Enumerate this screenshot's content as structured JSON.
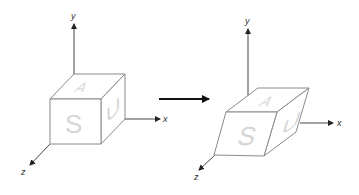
{
  "diagram": {
    "colors": {
      "axis": "#444444",
      "edge": "#8a8a8a",
      "face_letters": "#d6d6d6",
      "arrow": "#111111"
    },
    "left_figure": {
      "name": "original cube",
      "axes": {
        "x_label": "x",
        "y_label": "y",
        "z_label": "z"
      },
      "faces": {
        "front": "S",
        "top": "A",
        "right": "U"
      }
    },
    "transform_arrow": {
      "direction": "right"
    },
    "right_figure": {
      "name": "sheared cube",
      "axes": {
        "x_label": "x",
        "y_label": "y",
        "z_label": "z"
      },
      "faces": {
        "front": "S",
        "top": "A",
        "right": "U"
      }
    }
  }
}
